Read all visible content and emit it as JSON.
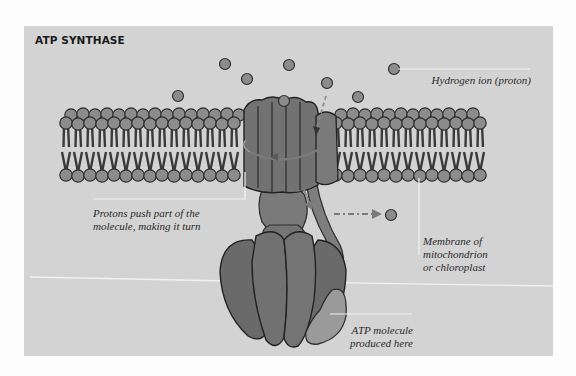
{
  "figure": {
    "title": "ATP SYNTHASE",
    "labels": {
      "proton": "Hydrogen ion (proton)",
      "rotor_line1": "Protons push part of the",
      "rotor_line2": "molecule, making it turn",
      "membrane_line1": "Membrane of mitochondrion",
      "membrane_line2": "or chloroplast",
      "atp_line1": "ATP molecule",
      "atp_line2": "produced here"
    },
    "icons": {
      "proton": "proton-circle-icon",
      "rotation_arrow": "curved-arrow-icon",
      "flow_arrow": "dashed-arrow-icon"
    },
    "colors": {
      "page_bg": "#fdfdfd",
      "panel_bg": "#d3d3d3",
      "lipid_head": "#8c8c8c",
      "outline": "#2e2e2e",
      "protein": "#6f6f6f",
      "protein_light": "#8a8a8a",
      "atp": "#9a9a9a",
      "leader_line": "#f4f4f4",
      "arrow": "#7a7a7a"
    }
  }
}
